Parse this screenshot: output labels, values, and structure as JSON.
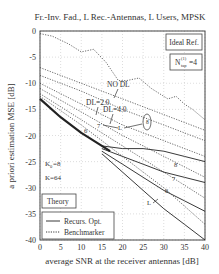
{
  "chart_data": {
    "type": "line",
    "title": "Fr.-Inv. Fad., L Rec.-Antennas, L Users, MPSK",
    "xlabel": "average SNR at the receiver antennas [dB]",
    "ylabel": "a priori estimation MSE [dB]",
    "xlim": [
      0,
      40
    ],
    "ylim": [
      -40,
      0
    ],
    "xticks": [
      "0",
      "5",
      "10",
      "15",
      "20",
      "25",
      "30",
      "35",
      "40"
    ],
    "yticks": [
      "0",
      "-5",
      "-10",
      "-15",
      "-20",
      "-25",
      "-30",
      "-35",
      "-40"
    ],
    "grid": true,
    "annotations": {
      "ideal_ref": "Ideal Ref.",
      "ntap_base": "N",
      "ntap_sup": "(1)",
      "ntap_sub": "tap",
      "ntap_val": "=4",
      "no_dl": "NO DL",
      "dl2": "DL=2.0",
      "dl4": "DL=4.0",
      "k0": "K",
      "k0_sub": "0",
      "k0_val": "=8",
      "k": "K=64",
      "theory": "Theory",
      "L_label": "L",
      "curve_labels": [
        "6",
        "7",
        "8",
        "6",
        "7",
        "8"
      ]
    },
    "legend": [
      {
        "label": "Recurs. Opt.",
        "style": "solid"
      },
      {
        "label": "Benchmarker",
        "style": "dotted"
      }
    ],
    "series": [
      {
        "name": "Theory",
        "style": "solid-bold",
        "x": [
          0,
          5,
          10,
          15,
          17
        ],
        "y": [
          -13,
          -16.5,
          -19.5,
          -22,
          -23
        ]
      },
      {
        "name": "Benchmarker NO DL",
        "style": "dotted",
        "x": [
          0,
          3,
          7,
          10,
          13,
          16,
          19,
          21,
          24,
          27,
          29,
          31,
          33,
          35,
          37,
          40
        ],
        "y": [
          -0.5,
          -1,
          -2.5,
          -4,
          -3.5,
          -6,
          -9.5,
          -9.5,
          -9,
          -11,
          -12,
          -13,
          -12.5,
          -14,
          -15,
          -17
        ]
      },
      {
        "name": "Benchmarker DL=2.0",
        "style": "dotted",
        "x": [
          0,
          10,
          20,
          30,
          40
        ],
        "y": [
          -7,
          -10,
          -13,
          -16,
          -19
        ]
      },
      {
        "name": "Benchmarker DL=4.0",
        "style": "dotted",
        "x": [
          0,
          10,
          20,
          30,
          40
        ],
        "y": [
          -8.5,
          -11.5,
          -15,
          -18,
          -21
        ]
      },
      {
        "name": "Recurs. Opt. L=8",
        "style": "solid",
        "x": [
          15,
          20,
          25,
          30,
          35,
          40
        ],
        "y": [
          -22,
          -22.5,
          -22.5,
          -23,
          -24,
          -25
        ]
      },
      {
        "name": "Recurs. Opt. L=7",
        "style": "solid",
        "x": [
          15,
          20,
          25,
          30,
          35,
          40
        ],
        "y": [
          -22.5,
          -24,
          -25.5,
          -27,
          -28,
          -29
        ]
      },
      {
        "name": "Recurs. Opt. L=6",
        "style": "solid",
        "x": [
          15,
          20,
          25,
          30,
          35,
          40
        ],
        "y": [
          -23,
          -25.5,
          -28,
          -30.5,
          -32.5,
          -34.5
        ]
      },
      {
        "name": "Recurs. Opt. L=5",
        "style": "solid",
        "x": [
          15,
          20,
          25,
          30,
          35,
          40
        ],
        "y": [
          -23.5,
          -27,
          -30.5,
          -34,
          -37,
          -40
        ]
      },
      {
        "name": "Benchmarker L=8",
        "style": "dotted",
        "x": [
          0,
          10,
          20,
          30,
          40
        ],
        "y": [
          -10,
          -14,
          -18,
          -21,
          -24
        ]
      },
      {
        "name": "Benchmarker L=7",
        "style": "dotted",
        "x": [
          0,
          10,
          20,
          30,
          40
        ],
        "y": [
          -11,
          -15.5,
          -20,
          -24,
          -28
        ]
      },
      {
        "name": "Benchmarker L=6",
        "style": "dotted",
        "x": [
          0,
          10,
          20,
          30,
          40
        ],
        "y": [
          -12,
          -17,
          -22,
          -27,
          -32
        ]
      },
      {
        "name": "Benchmarker L=5",
        "style": "dotted",
        "x": [
          0,
          10,
          20,
          30,
          40
        ],
        "y": [
          -12.5,
          -18,
          -24,
          -30,
          -37
        ]
      }
    ]
  }
}
